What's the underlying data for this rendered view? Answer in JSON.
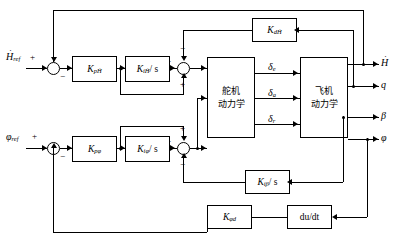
{
  "diagram": {
    "inputs": [
      {
        "id": "h-ref",
        "label": "H",
        "sub": "ref",
        "dot": true,
        "sign": "+"
      },
      {
        "id": "phi-ref",
        "label": "φ",
        "sub": "ref",
        "dot": false,
        "sign": "+"
      }
    ],
    "blocks": [
      {
        "id": "kp-hdot",
        "label": "K",
        "sub": "pḢ",
        "slash": ""
      },
      {
        "id": "ki-hdot",
        "label": "K",
        "sub": "iḢ",
        "slash": "/ s"
      },
      {
        "id": "kd-hdot",
        "label": "K",
        "sub": "dḢ",
        "slash": ""
      },
      {
        "id": "kp-phi",
        "label": "K",
        "sub": "pφ",
        "slash": ""
      },
      {
        "id": "ki-phi",
        "label": "K",
        "sub": "iφ",
        "slash": "/ s"
      },
      {
        "id": "ki-beta",
        "label": "K",
        "sub": "iβ",
        "slash": "/ s"
      },
      {
        "id": "kd-phi",
        "label": "K",
        "sub": "φd",
        "slash": ""
      },
      {
        "id": "derivative",
        "label": "du/dt",
        "sub": "",
        "slash": ""
      }
    ],
    "plants": [
      {
        "id": "actuator",
        "line1": "舵机",
        "line2": "动力学"
      },
      {
        "id": "airframe",
        "line1": "飞机",
        "line2": "动力学"
      }
    ],
    "internal_signals": [
      {
        "id": "delta-e",
        "label": "δ",
        "sub": "e"
      },
      {
        "id": "delta-a",
        "label": "δ",
        "sub": "a"
      },
      {
        "id": "delta-r",
        "label": "δ",
        "sub": "r"
      }
    ],
    "outputs": [
      {
        "id": "h-dot",
        "label": "H",
        "sub": "",
        "dot": true
      },
      {
        "id": "q",
        "label": "q",
        "sub": "",
        "dot": false
      },
      {
        "id": "beta",
        "label": "β",
        "sub": "",
        "dot": false
      },
      {
        "id": "phi",
        "label": "φ",
        "sub": "",
        "dot": false
      }
    ],
    "summers": [
      {
        "id": "sum-h-input",
        "signs": {
          "left": "+",
          "top": "",
          "bottom": "",
          "right_out": "−"
        }
      },
      {
        "id": "sum-h-inner",
        "signs": {
          "top": "−",
          "bottom": "+",
          "left": "+"
        }
      },
      {
        "id": "sum-phi-input",
        "signs": {
          "left": "+",
          "bottom": "",
          "right_out": "−"
        }
      },
      {
        "id": "sum-phi-inner",
        "signs": {
          "top": "+",
          "bottom": "−",
          "left": "+"
        }
      }
    ],
    "signs": {
      "plus": "+",
      "minus": "−"
    }
  }
}
